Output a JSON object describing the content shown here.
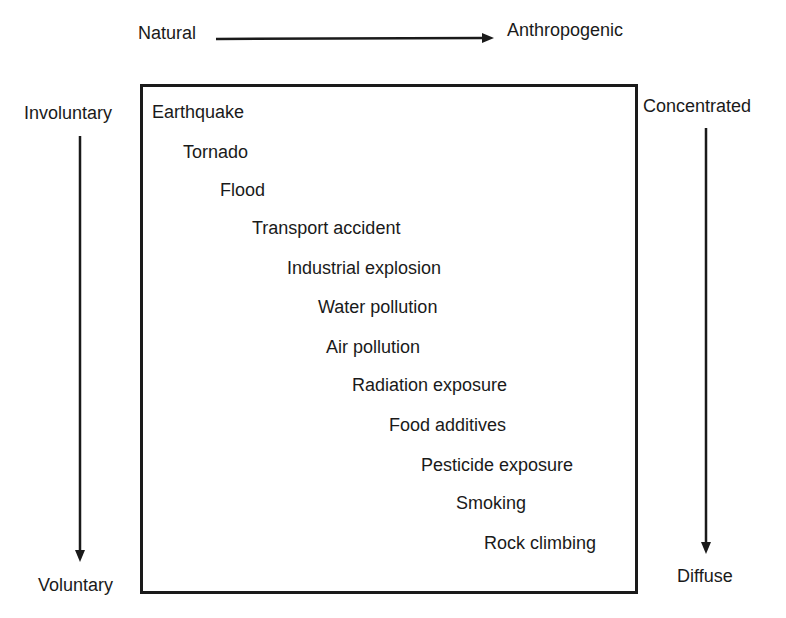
{
  "axes": {
    "top_left": "Natural",
    "top_right": "Anthropogenic",
    "left_top": "Involuntary",
    "left_bottom": "Voluntary",
    "right_top": "Concentrated",
    "right_bottom": "Diffuse"
  },
  "hazards": [
    {
      "label": "Earthquake",
      "x": 152,
      "y": 103
    },
    {
      "label": "Tornado",
      "x": 183,
      "y": 143
    },
    {
      "label": "Flood",
      "x": 220,
      "y": 181
    },
    {
      "label": "Transport accident",
      "x": 252,
      "y": 219
    },
    {
      "label": "Industrial explosion",
      "x": 287,
      "y": 259
    },
    {
      "label": "Water pollution",
      "x": 318,
      "y": 298
    },
    {
      "label": "Air pollution",
      "x": 326,
      "y": 338
    },
    {
      "label": "Radiation exposure",
      "x": 352,
      "y": 376
    },
    {
      "label": "Food additives",
      "x": 389,
      "y": 416
    },
    {
      "label": "Pesticide exposure",
      "x": 421,
      "y": 456
    },
    {
      "label": "Smoking",
      "x": 456,
      "y": 494
    },
    {
      "label": "Rock climbing",
      "x": 484,
      "y": 534
    }
  ]
}
